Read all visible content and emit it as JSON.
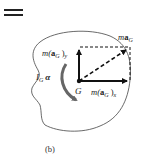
{
  "diagram": {
    "type": "kinetic-diagram",
    "equals_sign": "=",
    "caption": "(b)",
    "center_point": "G",
    "labels": {
      "ma_y": "m(aG)y",
      "ma_y_parts": {
        "m": "m(",
        "a": "a",
        "sub": "G",
        "close": ")",
        "axis": "y"
      },
      "ma_x": "m(aG)x",
      "ma_x_parts": {
        "m": "m(",
        "a": "a",
        "sub": "G",
        "close": ")",
        "axis": "x"
      },
      "ma_G": "maG",
      "ma_G_parts": {
        "m": "m",
        "a": "a",
        "sub": "G"
      },
      "moment": "IG α",
      "moment_parts": {
        "I": "I",
        "sub": "G",
        "alpha": "α"
      }
    },
    "colors": {
      "stroke": "#111111",
      "outline": "#444444",
      "curved_arrow": "#666666",
      "background": "#ffffff"
    }
  }
}
